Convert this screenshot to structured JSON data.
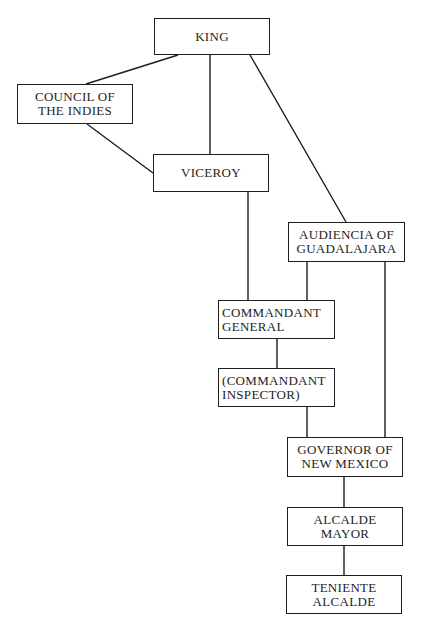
{
  "diagram": {
    "type": "organizational-chart",
    "nodes": [
      {
        "id": "king",
        "label": "KING"
      },
      {
        "id": "council",
        "label": "COUNCIL OF\nTHE INDIES"
      },
      {
        "id": "viceroy",
        "label": "VICEROY"
      },
      {
        "id": "audiencia",
        "label": "AUDIENCIA OF\nGUADALAJARA"
      },
      {
        "id": "commandant_general",
        "label": "COMMANDANT\nGENERAL"
      },
      {
        "id": "commandant_inspector",
        "label": "(COMMANDANT\nINSPECTOR)"
      },
      {
        "id": "governor",
        "label": "GOVERNOR OF\nNEW MEXICO"
      },
      {
        "id": "alcalde_mayor",
        "label": "ALCALDE\nMAYOR"
      },
      {
        "id": "teniente_alcalde",
        "label": "TENIENTE\nALCALDE"
      }
    ],
    "edges": [
      {
        "from": "king",
        "to": "council"
      },
      {
        "from": "king",
        "to": "viceroy"
      },
      {
        "from": "king",
        "to": "audiencia"
      },
      {
        "from": "council",
        "to": "viceroy"
      },
      {
        "from": "viceroy",
        "to": "commandant_general"
      },
      {
        "from": "audiencia",
        "to": "commandant_general"
      },
      {
        "from": "audiencia",
        "to": "governor"
      },
      {
        "from": "commandant_general",
        "to": "commandant_inspector"
      },
      {
        "from": "commandant_inspector",
        "to": "governor"
      },
      {
        "from": "governor",
        "to": "alcalde_mayor"
      },
      {
        "from": "alcalde_mayor",
        "to": "teniente_alcalde"
      }
    ],
    "colors": {
      "line": "#1e1e1e",
      "background": "#ffffff"
    }
  }
}
